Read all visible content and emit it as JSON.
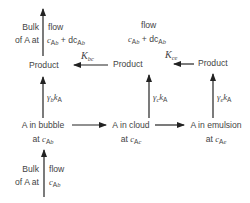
{
  "diagram": {
    "top_left_flow": {
      "left_lines": [
        "Bulk",
        "of A at"
      ],
      "right_word": "flow",
      "right_expr": {
        "c": "c",
        "sub": "A",
        "subi": "b",
        "plus": " + dc",
        "sub2": "A",
        "subi2": "b"
      }
    },
    "top_center_flow": {
      "word": "flow",
      "expr": {
        "c": "c",
        "sub": "A",
        "subi": "b",
        "plus": " + dc",
        "sub2": "A",
        "subi2": "b"
      }
    },
    "products": [
      "Product",
      "Product",
      "Product"
    ],
    "exchange_labels": [
      {
        "K": "K",
        "sub": "bc"
      },
      {
        "K": "K",
        "sub": "ce"
      }
    ],
    "reaction_labels": [
      {
        "gamma": "γ",
        "gsub": "b",
        "k": "k",
        "ksub": "A"
      },
      {
        "gamma": "γ",
        "gsub": "c",
        "k": "k",
        "ksub": "A"
      },
      {
        "gamma": "γ",
        "gsub": "e",
        "k": "k",
        "ksub": "A"
      }
    ],
    "phases": [
      {
        "line1": "A in bubble",
        "at": "at ",
        "c": "c",
        "sub": "A",
        "subi": "b"
      },
      {
        "line1": "A in cloud",
        "at": "at ",
        "c": "c",
        "sub": "A",
        "subi": "c"
      },
      {
        "line1": "A in emulsion",
        "at": "at ",
        "c": "c",
        "sub": "A",
        "subi": "e"
      }
    ],
    "bottom_flow": {
      "left_lines": [
        "Bulk",
        "of A at"
      ],
      "right_word": "flow",
      "right_expr": {
        "c": "c",
        "sub": "A",
        "subi": "b"
      }
    },
    "colors": {
      "line": "#222222",
      "text": "#444444"
    }
  }
}
